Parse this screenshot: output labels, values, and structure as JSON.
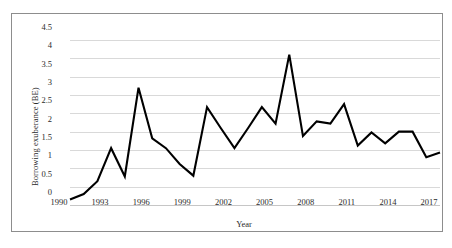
{
  "chart_data": {
    "type": "line",
    "title": "",
    "xlabel": "Year",
    "ylabel": "Borrowing exuberance (BE)",
    "xlim": [
      1990,
      2017
    ],
    "ylim": [
      0,
      4.5
    ],
    "grid": true,
    "legend": false,
    "legend_position": "none",
    "line_color": "#000000",
    "gridline_color": "#d9d9d9",
    "x_tick_labels": [
      "1990",
      "1993",
      "1996",
      "1999",
      "2002",
      "2005",
      "2008",
      "2011",
      "2014",
      "2017"
    ],
    "x_ticks": [
      1990,
      1993,
      1996,
      1999,
      2002,
      2005,
      2008,
      2011,
      2014,
      2017
    ],
    "y_tick_labels": [
      "0",
      "0.5",
      "1",
      "1.5",
      "2",
      "2.5",
      "3",
      "3.5",
      "4",
      "4.5"
    ],
    "y_ticks": [
      0,
      0.5,
      1,
      1.5,
      2,
      2.5,
      3,
      3.5,
      4,
      4.5
    ],
    "x": [
      1990,
      1991,
      1992,
      1993,
      1994,
      1995,
      1996,
      1997,
      1998,
      1999,
      2000,
      2001,
      2002,
      2003,
      2004,
      2005,
      2006,
      2007,
      2008,
      2009,
      2010,
      2011,
      2012,
      2013,
      2014,
      2015,
      2016,
      2017
    ],
    "values": [
      0.15,
      0.3,
      0.65,
      1.55,
      0.78,
      3.2,
      1.82,
      1.55,
      1.12,
      0.8,
      2.67,
      2.1,
      1.55,
      2.1,
      2.67,
      2.22,
      4.1,
      1.88,
      2.28,
      2.22,
      2.75,
      1.62,
      1.98,
      1.68,
      2.0,
      2.0,
      1.3,
      1.43
    ],
    "series": [
      {
        "name": "Borrowing exuberance (BE)",
        "values": [
          0.15,
          0.3,
          0.65,
          1.55,
          0.78,
          3.2,
          1.82,
          1.55,
          1.12,
          0.8,
          2.67,
          2.1,
          1.55,
          2.1,
          2.67,
          2.22,
          4.1,
          1.88,
          2.28,
          2.22,
          2.75,
          1.62,
          1.98,
          1.68,
          2.0,
          2.0,
          1.3,
          1.43
        ]
      }
    ]
  }
}
